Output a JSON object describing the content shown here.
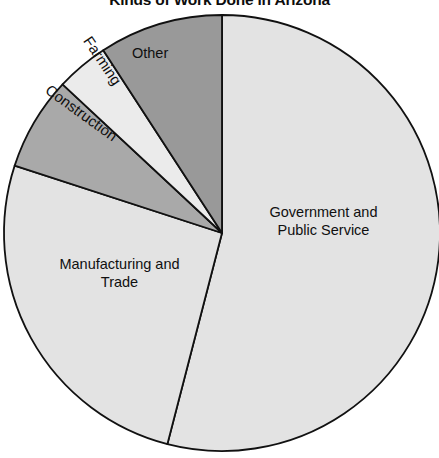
{
  "chart_data": {
    "type": "pie",
    "title": "Kinds of Work Done in Arizona",
    "xlabel": "",
    "ylabel": "",
    "legend_position": "none",
    "grid": false,
    "labels_inside_slices": true,
    "categories": [
      "Government and Public Service",
      "Manufacturing and Trade",
      "Construction",
      "Farming",
      "Other"
    ],
    "values": [
      54,
      27,
      7,
      4,
      8
    ],
    "units": "percent",
    "slices": [
      {
        "label": "Government and\nPublic Service",
        "label_display": "Government and Public Service",
        "value": 54,
        "start_angle": 0,
        "end_angle": 194.5,
        "color": "#e3e3e3"
      },
      {
        "label": "Manufacturing and\nTrade",
        "label_display": "Manufacturing and Trade",
        "value": 27,
        "start_angle": 194.5,
        "end_angle": 288,
        "color": "#e3e3e3"
      },
      {
        "label": "Construction",
        "label_display": "Construction",
        "value": 7,
        "start_angle": 288,
        "end_angle": 313,
        "color": "#a9a9a9"
      },
      {
        "label": "Farming",
        "label_display": "Farming",
        "value": 4,
        "start_angle": 313,
        "end_angle": 327,
        "color": "#ebebeb"
      },
      {
        "label": "Other",
        "label_display": "Other",
        "value": 8,
        "start_angle": 327,
        "end_angle": 360,
        "color": "#999999"
      }
    ],
    "geometry": {
      "center_x": 222,
      "center_y": 233,
      "radius": 218
    },
    "colors": {
      "background": "#ffffff",
      "outline": "#111111",
      "title_text": "#0d0d0d",
      "label_text": "#101010"
    }
  },
  "labels": {
    "government": "Government and\nPublic Service",
    "manufacturing": "Manufacturing and\nTrade",
    "construction": "Construction",
    "farming": "Farming",
    "other": "Other"
  }
}
